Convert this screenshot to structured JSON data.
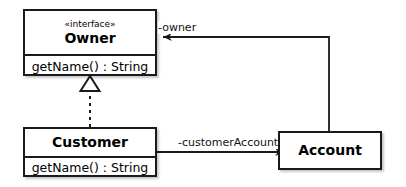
{
  "diagram": {
    "background_color": "#ffffff",
    "line_color": "#1a1a1a",
    "text_color": "#000000"
  },
  "classes": [
    {
      "id": "owner",
      "stereotype": "«interface»",
      "name": "Owner",
      "members": [
        "getName() : String"
      ],
      "x": 23,
      "y": 9,
      "width": 134,
      "height": 67,
      "header_height": 43
    },
    {
      "id": "customer",
      "stereotype": "",
      "name": "Customer",
      "members": [
        "getName() : String"
      ],
      "x": 23,
      "y": 127,
      "width": 134,
      "height": 50,
      "header_height": 28
    },
    {
      "id": "account",
      "stereotype": "",
      "name": "Account",
      "members": [],
      "x": 278,
      "y": 131,
      "width": 104,
      "height": 39,
      "header_height": 39
    }
  ],
  "relationships": [
    {
      "id": "realization",
      "kind": "realization",
      "from": "customer",
      "to": "owner",
      "label": "",
      "style": "dashed",
      "arrowhead": "hollow-triangle"
    },
    {
      "id": "owner-assoc",
      "kind": "association",
      "from": "account",
      "to": "owner",
      "label": "-owner",
      "style": "solid",
      "arrowhead": "open-arrow"
    },
    {
      "id": "customer-account-assoc",
      "kind": "association",
      "from": "customer",
      "to": "account",
      "label": "-customerAccount",
      "style": "solid",
      "arrowhead": "open-arrow"
    }
  ],
  "labels": {
    "owner_role": "-owner",
    "customer_account_role": "-customerAccount"
  }
}
